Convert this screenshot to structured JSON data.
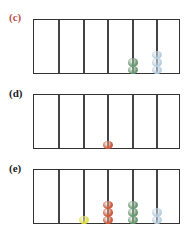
{
  "colors": {
    "label_c": "#c0504d",
    "label_default": "#222222",
    "frame": "#333333",
    "green": "#6a9a72",
    "lightblue": "#b9cfe0",
    "orange": "#cc5a3c",
    "yellow": "#e3e04a"
  },
  "panels": [
    {
      "label": "(c)",
      "label_color": "#c0504d",
      "top": 19,
      "label_top": 11,
      "columns": [
        {
          "x": 25,
          "type": "divider"
        },
        {
          "x": 50,
          "type": "divider"
        },
        {
          "x": 74,
          "type": "divider"
        },
        {
          "x": 99,
          "type": "rod",
          "beads": [
            "green",
            "green"
          ]
        },
        {
          "x": 123,
          "type": "rod",
          "beads": [
            "lightblue",
            "lightblue",
            "lightblue"
          ]
        }
      ]
    },
    {
      "label": "(d)",
      "label_color": "#222222",
      "top": 94,
      "label_top": 87,
      "columns": [
        {
          "x": 25,
          "type": "divider"
        },
        {
          "x": 50,
          "type": "divider"
        },
        {
          "x": 74,
          "type": "rod",
          "beads": [
            "orange"
          ]
        },
        {
          "x": 99,
          "type": "divider"
        },
        {
          "x": 123,
          "type": "divider"
        }
      ]
    },
    {
      "label": "(e)",
      "label_color": "#222222",
      "top": 169,
      "label_top": 162,
      "columns": [
        {
          "x": 25,
          "type": "divider"
        },
        {
          "x": 50,
          "type": "rod",
          "beads": [
            "yellow"
          ]
        },
        {
          "x": 74,
          "type": "rod",
          "beads": [
            "orange",
            "orange",
            "orange"
          ]
        },
        {
          "x": 99,
          "type": "rod",
          "beads": [
            "green",
            "green",
            "green"
          ]
        },
        {
          "x": 123,
          "type": "rod",
          "beads": [
            "lightblue",
            "lightblue"
          ]
        }
      ]
    }
  ]
}
